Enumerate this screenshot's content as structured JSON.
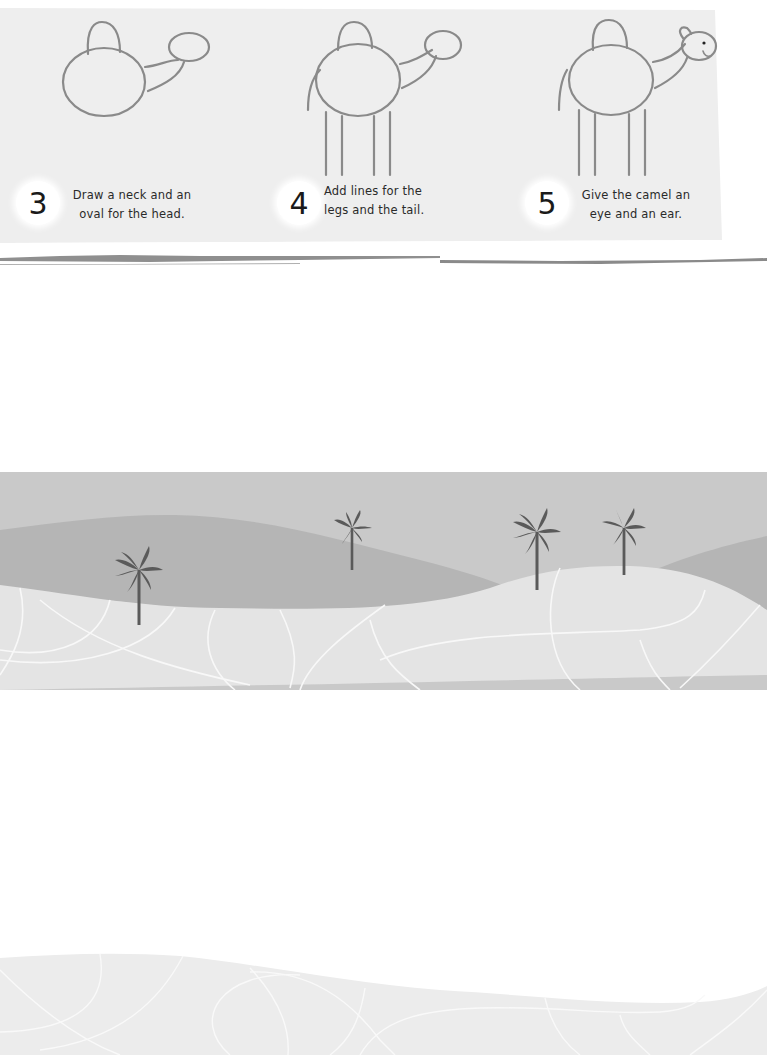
{
  "page": {
    "background": "#ffffff",
    "panel_color": "#eeeeee"
  },
  "steps": [
    {
      "number": "3",
      "line1": "Draw a neck and an",
      "line2": "oval for the head.",
      "icon": "camel-drawing-step-3"
    },
    {
      "number": "4",
      "line1": "Add lines for the",
      "line2": "legs and the tail.",
      "icon": "camel-drawing-step-4"
    },
    {
      "number": "5",
      "line1": "Give the camel an",
      "line2": "eye and an ear.",
      "icon": "camel-drawing-step-5"
    }
  ],
  "scene": {
    "sky_color": "#c9c9c9",
    "back_dune_color": "#b5b5b5",
    "front_sand_color": "#e4e4e4",
    "palm_color": "#5a5a5a",
    "palm_tree_count": 4,
    "icons": [
      "palm-tree-icon",
      "sand-dune",
      "sand-swirl-lines"
    ]
  },
  "bottom": {
    "sand_color": "#ececec"
  }
}
